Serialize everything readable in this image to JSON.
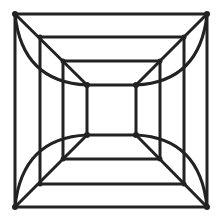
{
  "figure": {
    "stroke_color": "#222222",
    "background": "#ffffff",
    "squares": [
      {
        "name": "outer",
        "x1": 15,
        "y1": 14,
        "x2": 207,
        "y2": 207
      },
      {
        "name": "second",
        "x1": 40,
        "y1": 37,
        "x2": 184,
        "y2": 184
      },
      {
        "name": "third",
        "x1": 63,
        "y1": 61,
        "x2": 160,
        "y2": 159
      },
      {
        "name": "inner",
        "x1": 87,
        "y1": 85,
        "x2": 136,
        "y2": 135
      }
    ]
  }
}
